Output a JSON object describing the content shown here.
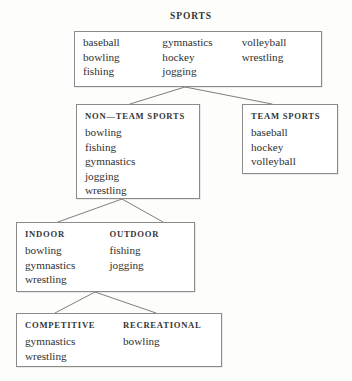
{
  "diagram": {
    "title": "SPORTS",
    "type": "taxonomy-tree",
    "border_color": "#8b8b8b",
    "text_color": "#2f2f2f",
    "background": "#fdfdfc",
    "nodes": {
      "sports": {
        "label": "SPORTS",
        "columns": [
          {
            "header": "",
            "items": [
              "baseball",
              "bowling",
              "fishing"
            ]
          },
          {
            "header": "",
            "items": [
              "gymnastics",
              "hockey",
              "jogging"
            ]
          },
          {
            "header": "",
            "items": [
              "volleyball",
              "wrestling"
            ]
          }
        ]
      },
      "non_team_sports": {
        "columns": [
          {
            "header": "NON—TEAM SPORTS",
            "items": [
              "bowling",
              "fishing",
              "gymnastics",
              "jogging",
              "wrestling"
            ]
          }
        ]
      },
      "team_sports": {
        "columns": [
          {
            "header": "TEAM SPORTS",
            "items": [
              "baseball",
              "hockey",
              "volleyball"
            ]
          }
        ]
      },
      "indoor_outdoor": {
        "columns": [
          {
            "header": "INDOOR",
            "items": [
              "bowling",
              "gymnastics",
              "wrestling"
            ]
          },
          {
            "header": "OUTDOOR",
            "items": [
              "fishing",
              "jogging"
            ]
          }
        ]
      },
      "competitive_recreational": {
        "columns": [
          {
            "header": "COMPETITIVE",
            "items": [
              "gymnastics",
              "wrestling"
            ]
          },
          {
            "header": "RECREATIONAL",
            "items": [
              "bowling"
            ]
          }
        ]
      }
    }
  }
}
